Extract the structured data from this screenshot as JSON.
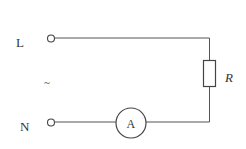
{
  "diagram": {
    "type": "circuit",
    "terminals": [
      {
        "id": "L",
        "label": "L"
      },
      {
        "id": "N",
        "label": "N"
      }
    ],
    "source_symbol": "~",
    "resistor": {
      "label": "R"
    },
    "ammeter": {
      "label": "A"
    },
    "colors": {
      "wire": "#555555",
      "text": "#333333",
      "background": "#ffffff"
    }
  }
}
